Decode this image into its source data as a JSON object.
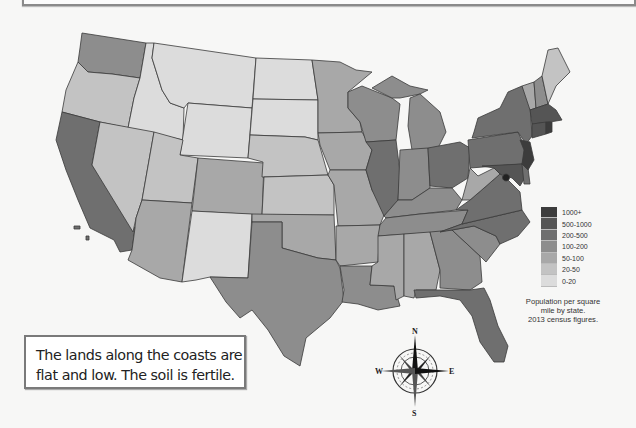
{
  "note": {
    "text": "The lands along the coasts are flat and low.  The soil is fertile."
  },
  "legend": {
    "title": "Population per square mile by state. 2013 census figures.",
    "caption_lines": [
      "Population per square",
      "mile by state.",
      "2013 census figures."
    ],
    "items": [
      {
        "label": "1000+",
        "color": "#3c3c3c"
      },
      {
        "label": "500-1000",
        "color": "#555555"
      },
      {
        "label": "200-500",
        "color": "#6f6f6f"
      },
      {
        "label": "100-200",
        "color": "#8d8d8d"
      },
      {
        "label": "50-100",
        "color": "#a8a8a8"
      },
      {
        "label": "20-50",
        "color": "#c3c3c3"
      },
      {
        "label": "0-20",
        "color": "#dcdcdc"
      }
    ]
  },
  "compass": {
    "north": "N",
    "south": "S",
    "east": "E",
    "west": "W"
  },
  "map": {
    "subject": "Contiguous United States population density",
    "states": [
      {
        "name": "Washington",
        "class": "100-200"
      },
      {
        "name": "Oregon",
        "class": "20-50"
      },
      {
        "name": "California",
        "class": "200-500"
      },
      {
        "name": "Idaho",
        "class": "0-20"
      },
      {
        "name": "Nevada",
        "class": "20-50"
      },
      {
        "name": "Montana",
        "class": "0-20"
      },
      {
        "name": "Wyoming",
        "class": "0-20"
      },
      {
        "name": "Utah",
        "class": "20-50"
      },
      {
        "name": "Arizona",
        "class": "50-100"
      },
      {
        "name": "Colorado",
        "class": "50-100"
      },
      {
        "name": "New Mexico",
        "class": "0-20"
      },
      {
        "name": "North Dakota",
        "class": "0-20"
      },
      {
        "name": "South Dakota",
        "class": "0-20"
      },
      {
        "name": "Nebraska",
        "class": "20-50"
      },
      {
        "name": "Kansas",
        "class": "20-50"
      },
      {
        "name": "Oklahoma",
        "class": "50-100"
      },
      {
        "name": "Texas",
        "class": "100-200"
      },
      {
        "name": "Minnesota",
        "class": "50-100"
      },
      {
        "name": "Iowa",
        "class": "50-100"
      },
      {
        "name": "Missouri",
        "class": "50-100"
      },
      {
        "name": "Arkansas",
        "class": "50-100"
      },
      {
        "name": "Louisiana",
        "class": "100-200"
      },
      {
        "name": "Wisconsin",
        "class": "100-200"
      },
      {
        "name": "Illinois",
        "class": "200-500"
      },
      {
        "name": "Michigan",
        "class": "100-200"
      },
      {
        "name": "Indiana",
        "class": "100-200"
      },
      {
        "name": "Ohio",
        "class": "200-500"
      },
      {
        "name": "Kentucky",
        "class": "100-200"
      },
      {
        "name": "Tennessee",
        "class": "100-200"
      },
      {
        "name": "Mississippi",
        "class": "50-100"
      },
      {
        "name": "Alabama",
        "class": "50-100"
      },
      {
        "name": "Georgia",
        "class": "100-200"
      },
      {
        "name": "Florida",
        "class": "200-500"
      },
      {
        "name": "South Carolina",
        "class": "100-200"
      },
      {
        "name": "North Carolina",
        "class": "200-500"
      },
      {
        "name": "Virginia",
        "class": "200-500"
      },
      {
        "name": "West Virginia",
        "class": "50-100"
      },
      {
        "name": "Pennsylvania",
        "class": "200-500"
      },
      {
        "name": "New York",
        "class": "200-500"
      },
      {
        "name": "Maryland",
        "class": "500-1000"
      },
      {
        "name": "Delaware",
        "class": "200-500"
      },
      {
        "name": "New Jersey",
        "class": "1000+"
      },
      {
        "name": "Connecticut",
        "class": "500-1000"
      },
      {
        "name": "Rhode Island",
        "class": "1000+"
      },
      {
        "name": "Massachusetts",
        "class": "500-1000"
      },
      {
        "name": "Vermont",
        "class": "50-100"
      },
      {
        "name": "New Hampshire",
        "class": "100-200"
      },
      {
        "name": "Maine",
        "class": "20-50"
      },
      {
        "name": "District of Columbia",
        "class": "1000+"
      }
    ]
  }
}
